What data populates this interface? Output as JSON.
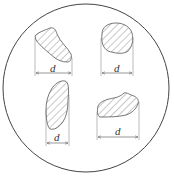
{
  "diagram": {
    "colors": {
      "stroke": "#555555",
      "hatch": "#777777",
      "background": "#ffffff"
    },
    "particles": [
      {
        "id": "top-left",
        "dimension_label": "d"
      },
      {
        "id": "top-right",
        "dimension_label": "d"
      },
      {
        "id": "bottom-left",
        "dimension_label": "d"
      },
      {
        "id": "bottom-right",
        "dimension_label": "d"
      }
    ]
  }
}
